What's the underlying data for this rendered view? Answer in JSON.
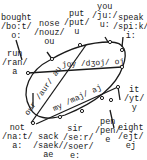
{
  "diagram": {
    "type": "vowel-chart",
    "words": [
      {
        "id": "bought",
        "word": "bought",
        "ipa": "/bo:t/",
        "vowel": "o:"
      },
      {
        "id": "nose",
        "word": "nose",
        "ipa": "/nouz/",
        "vowel": "ou"
      },
      {
        "id": "put",
        "word": "put",
        "ipa": "/put/",
        "vowel": "u"
      },
      {
        "id": "you",
        "word": "you",
        "ipa": "/ju:/",
        "vowel": "u:"
      },
      {
        "id": "speak",
        "word": "speak",
        "ipa": "/spi:k/",
        "vowel": "i:"
      },
      {
        "id": "run",
        "word": "run",
        "ipa": "/ran/",
        "vowel": "a"
      },
      {
        "id": "it",
        "word": "it",
        "ipa": "/yt/",
        "vowel": "y"
      },
      {
        "id": "not",
        "word": "not",
        "ipa": "/na:t/",
        "vowel": "a:"
      },
      {
        "id": "sack",
        "word": "sack",
        "ipa": "/saek/",
        "vowel": "ae"
      },
      {
        "id": "sir",
        "word": "sir",
        "ipa": "/se:r/ /soer/",
        "vowel": "e: =oe"
      },
      {
        "id": "pen",
        "word": "pen",
        "ipa": "/pen/",
        "vowel": "e"
      },
      {
        "id": "eight",
        "word": "eight",
        "ipa": "/ejt/",
        "vowel": "ej"
      }
    ],
    "diphthongs": [
      {
        "id": "joy",
        "label": "joy /dʒoj/ oj"
      },
      {
        "id": "our",
        "label": "our /aur/ au"
      },
      {
        "id": "my",
        "label": "my /maj/ aj"
      }
    ]
  }
}
